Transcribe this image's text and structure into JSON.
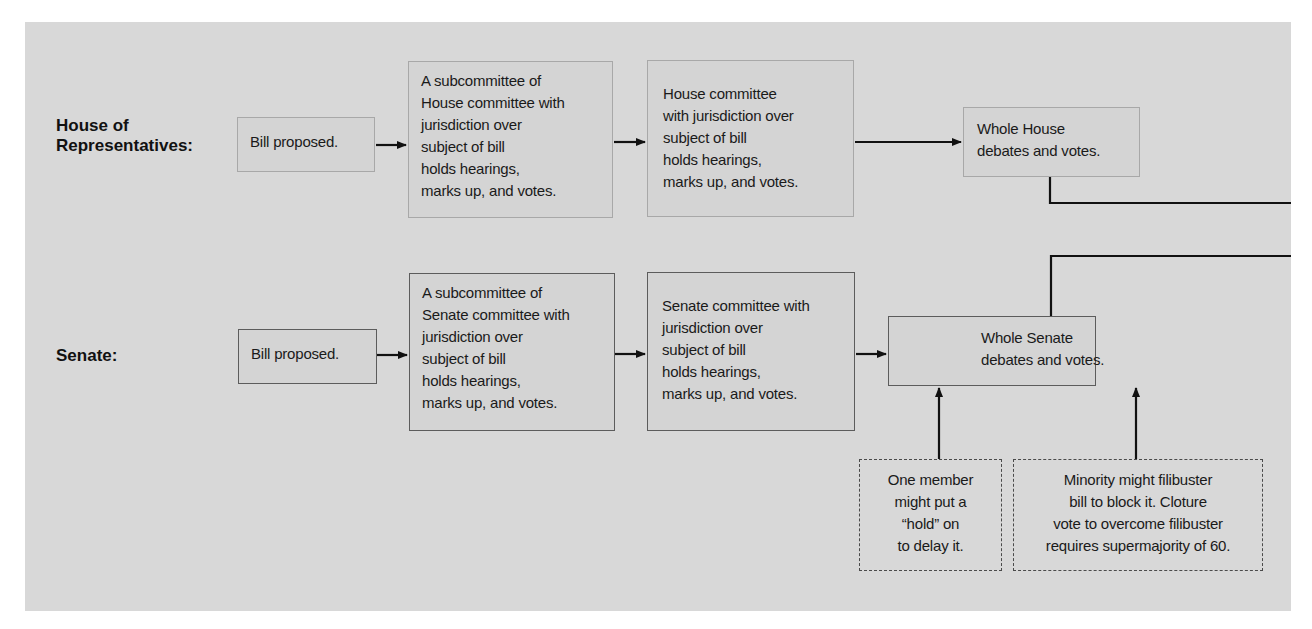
{
  "diagram": {
    "type": "flowchart",
    "colors": {
      "panel_background": "#d8d8d8",
      "box_fill": "#d4d4d4",
      "house_border": "#a8a8a8",
      "senate_border": "#5c5c5c",
      "arrow": "#111111"
    }
  },
  "house": {
    "label_lines": [
      "House of",
      "Representatives:"
    ],
    "steps": [
      {
        "id": "house-bill",
        "lines": [
          "Bill proposed."
        ]
      },
      {
        "id": "house-subcommittee",
        "lines": [
          "A subcommittee of",
          "House committee with",
          "jurisdiction over",
          "subject of bill",
          "holds hearings,",
          "marks up, and votes."
        ]
      },
      {
        "id": "house-committee",
        "lines": [
          "House committee",
          "with jurisdiction over",
          "subject of bill",
          "holds hearings,",
          "marks up, and votes."
        ]
      },
      {
        "id": "house-floor",
        "lines": [
          "Whole House",
          "debates and votes."
        ]
      }
    ]
  },
  "senate": {
    "label_lines": [
      "Senate:"
    ],
    "steps": [
      {
        "id": "senate-bill",
        "lines": [
          "Bill proposed."
        ]
      },
      {
        "id": "senate-subcommittee",
        "lines": [
          "A subcommittee of",
          "Senate committee with",
          "jurisdiction over",
          "subject of bill",
          "holds hearings,",
          "marks up, and votes."
        ]
      },
      {
        "id": "senate-committee",
        "lines": [
          "Senate committee with",
          "jurisdiction over",
          "subject of bill",
          "holds hearings,",
          "marks up, and votes."
        ]
      },
      {
        "id": "senate-floor",
        "lines": [
          "Whole Senate",
          "debates and votes."
        ]
      }
    ],
    "obstacles": [
      {
        "id": "hold",
        "lines": [
          "One member",
          "might put a",
          "“hold” on",
          "to delay it."
        ]
      },
      {
        "id": "filibuster",
        "lines": [
          "Minority might filibuster",
          "bill to block it. Cloture",
          "vote to overcome filibuster",
          "requires supermajority of 60."
        ]
      }
    ]
  },
  "edges": [
    {
      "from": "house-bill",
      "to": "house-subcommittee"
    },
    {
      "from": "house-subcommittee",
      "to": "house-committee"
    },
    {
      "from": "house-committee",
      "to": "house-floor"
    },
    {
      "from": "house-floor",
      "to": "continues-right"
    },
    {
      "from": "senate-bill",
      "to": "senate-subcommittee"
    },
    {
      "from": "senate-subcommittee",
      "to": "senate-committee"
    },
    {
      "from": "senate-committee",
      "to": "senate-floor"
    },
    {
      "from": "senate-floor",
      "to": "continues-right"
    },
    {
      "from": "hold",
      "to": "senate-floor"
    },
    {
      "from": "filibuster",
      "to": "senate-floor"
    }
  ]
}
